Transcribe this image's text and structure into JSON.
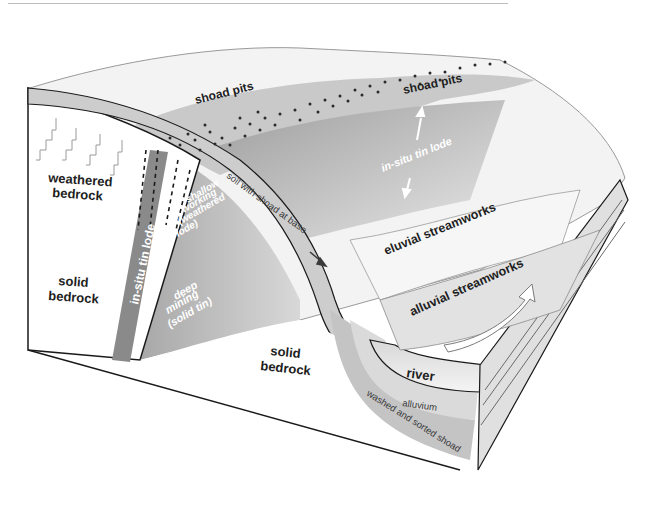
{
  "diagram": {
    "type": "block-diagram",
    "colors": {
      "background": "#ffffff",
      "surface_light": "#f2f2f2",
      "soil_band": "#cfcfcf",
      "lode_dark": "#8c8c8c",
      "hillside_grey": "#b3b3b3",
      "outline": "#1a1a1a",
      "shoad_band": "#c8c8c8",
      "river": "#e9e9e9"
    },
    "labels": {
      "weathered_bedrock": [
        "weathered",
        "bedrock"
      ],
      "solid_bedrock_left": [
        "solid",
        "bedrock"
      ],
      "solid_bedrock_front": [
        "solid",
        "bedrock"
      ],
      "in_situ_tin_lode_vertical": "in-situ tin lode",
      "shallow_working": [
        "shallow",
        "working",
        "(weathered",
        "lode)"
      ],
      "deep_mining": [
        "deep",
        "mining",
        "(solid tin)"
      ],
      "soil_with_shoad": "soil with shoad at base",
      "shoad_pits_left": "shoad pits",
      "shoad_pits_right": "shoad pits",
      "in_situ_tin_lode_surface": "in-situ tin lode",
      "eluvial_streamworks": "eluvial streamworks",
      "alluvial_streamworks": "alluvial streamworks",
      "river": "river",
      "alluvium": "alluvium",
      "washed_sorted_shoad": "washed and sorted shoad"
    },
    "icons": [
      "up-arrow-icon",
      "down-arrow-icon",
      "flow-arrow-icon",
      "shoad-pit-dots"
    ]
  }
}
